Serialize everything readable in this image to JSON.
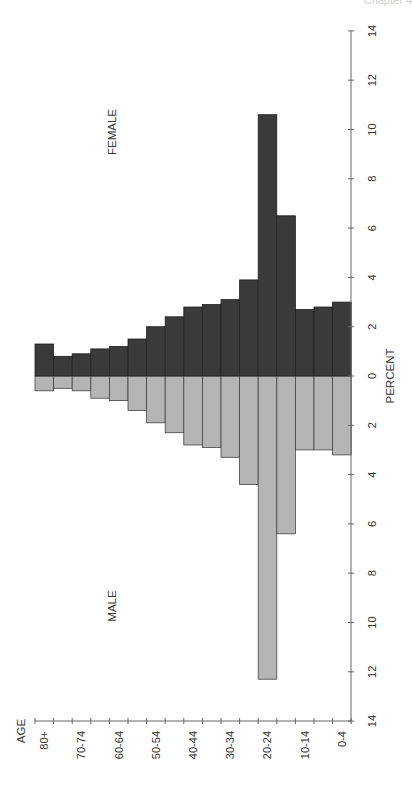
{
  "page": {
    "corner_text": "Chapter 4"
  },
  "chart_data": {
    "type": "bar",
    "subtype": "population-pyramid",
    "orientation": "rotated-90",
    "title": "",
    "xlabel": "AGE",
    "ylabel": "PERCENT",
    "categories": [
      "80+",
      "75-79",
      "70-74",
      "65-69",
      "60-64",
      "55-59",
      "50-54",
      "45-49",
      "40-44",
      "35-39",
      "30-34",
      "25-29",
      "20-24",
      "15-19",
      "10-14",
      "5-9",
      "0-4"
    ],
    "category_tick_labels": [
      "80+",
      "70-74",
      "60-64",
      "50-54",
      "40-44",
      "30-34",
      "20-24",
      "10-14",
      "0-4"
    ],
    "series": [
      {
        "name": "FEMALE",
        "color": "#3a3a3a",
        "values": [
          1.3,
          0.8,
          0.9,
          1.1,
          1.2,
          1.5,
          2.0,
          2.4,
          2.8,
          2.9,
          3.1,
          3.9,
          10.6,
          6.5,
          2.7,
          2.8,
          3.0
        ]
      },
      {
        "name": "MALE",
        "color": "#b4b4b4",
        "values": [
          0.6,
          0.5,
          0.6,
          0.9,
          1.0,
          1.4,
          1.9,
          2.3,
          2.8,
          2.9,
          3.3,
          4.4,
          12.3,
          6.4,
          3.0,
          3.0,
          3.2
        ]
      }
    ],
    "value_axis": {
      "ticks": [
        14,
        12,
        10,
        8,
        6,
        4,
        2,
        0,
        2,
        4,
        6,
        8,
        10,
        12,
        14
      ],
      "range_female": [
        0,
        14
      ],
      "range_male": [
        0,
        14
      ]
    },
    "grid": false,
    "legend": "inline labels (FEMALE above axis, MALE below axis)"
  }
}
